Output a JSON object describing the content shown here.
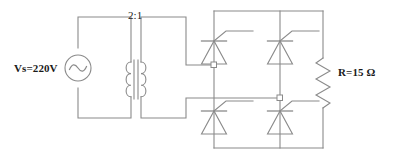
{
  "diagram": {
    "stroke_color": "#8a8a8a",
    "text_color": "#1a1a1a",
    "background_color": "#ffffff"
  },
  "labels": {
    "source": "Vs=220V",
    "transformer_ratio": "2:1",
    "load": "R=15 Ω"
  },
  "components": {
    "ac_source": {
      "name": "ac-voltage-source",
      "symbol": "circle-with-sine",
      "value": "220V"
    },
    "transformer": {
      "name": "transformer",
      "ratio": "2:1",
      "primary_turns": 3,
      "secondary_turns": 3
    },
    "thyristors": [
      {
        "id": "T1",
        "position": "top-left"
      },
      {
        "id": "T2",
        "position": "top-right"
      },
      {
        "id": "T3",
        "position": "bottom-left"
      },
      {
        "id": "T4",
        "position": "bottom-right"
      }
    ],
    "resistor": {
      "name": "load-resistor",
      "value": "15",
      "unit": "Ω",
      "zigzag_peaks": 5
    },
    "nodes": [
      {
        "id": "N1",
        "label": "ac-terminal-left"
      },
      {
        "id": "N2",
        "label": "ac-terminal-right"
      }
    ]
  }
}
